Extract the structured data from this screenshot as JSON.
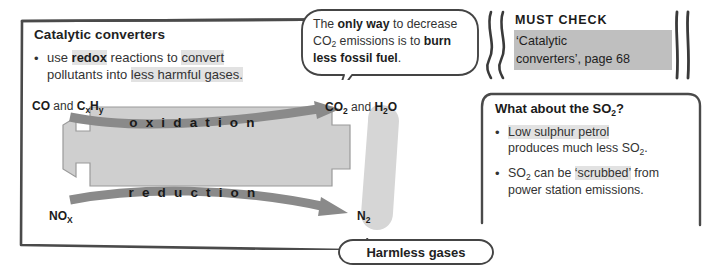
{
  "main_panel": {
    "title": "Catalytic converters",
    "bullet_marker": "•",
    "bullet_line1_pre": "use ",
    "bullet_line1_key": "redox",
    "bullet_line1_mid": " reactions to ",
    "bullet_line1_hl": "convert",
    "bullet_line2_pre": "pollutants into ",
    "bullet_line2_hl": "less harmful gases."
  },
  "diagram": {
    "inlet_top_bold1": "CO",
    "inlet_top_reg": " and ",
    "inlet_top_bold2": "C",
    "inlet_top_sub2": "x",
    "inlet_top_bold3": "H",
    "inlet_top_sub3": "y",
    "inlet_bottom_bold": "NO",
    "inlet_bottom_sub": "X",
    "outlet_top_bold1": "CO",
    "outlet_top_sub1": "2",
    "outlet_top_reg": " and ",
    "outlet_top_bold2": "H",
    "outlet_top_sub2": "2",
    "outlet_top_bold3": "O",
    "outlet_bottom_bold": "N",
    "outlet_bottom_sub": "2",
    "label_oxidation": "o x i d a t i o n",
    "label_reduction": "r e d u c t i o n",
    "body_color": "#cfcfcf",
    "arrow_color": "#8a8a8a",
    "blob_color": "#d4d4d4"
  },
  "speech_bubble": {
    "part1": "The ",
    "bold1": "only way",
    "part2": " to decrease",
    "line2_pre": "CO",
    "line2_sub": "2",
    "line2_mid": " emissions is to ",
    "bold2": "burn",
    "bold3": "less fossil fuel",
    "part3": "."
  },
  "must_check": {
    "title": "MUST CHECK",
    "line1": "‘Catalytic",
    "line2": "converters’, page 68",
    "highlight_color": "#bfbfbf"
  },
  "so2_panel": {
    "title_pre": "What about the SO",
    "title_sub": "2",
    "title_post": "?",
    "bullet_marker": "•",
    "b1_l1_hl": "Low sulphur petrol",
    "b1_l2_pre": "produces much less SO",
    "b1_l2_sub": "2",
    "b1_l2_post": ".",
    "b2_l1_pre": "SO",
    "b2_l1_sub": "2",
    "b2_l1_mid": " can be ",
    "b2_l1_hl": "‘scrubbed’",
    "b2_l1_post": " from",
    "b2_l2": "power station emissions."
  },
  "harmless_pill": {
    "label": "Harmless gases"
  }
}
